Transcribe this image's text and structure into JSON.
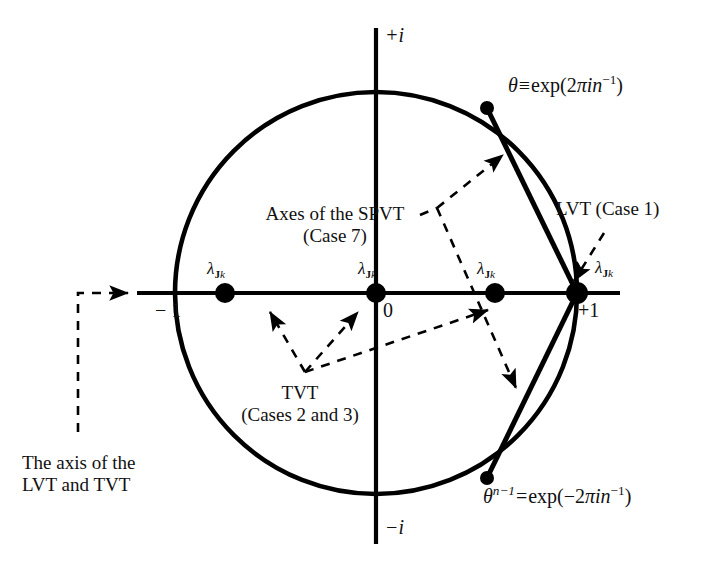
{
  "figure": {
    "background_color": "#ffffff",
    "stroke_color": "#000000"
  },
  "axes": {
    "imaginary_positive": "+i",
    "imaginary_negative": "−i",
    "real_negative": "− 1",
    "real_positive": "+1",
    "origin": "0"
  },
  "unit_circle": {
    "center_x": 376,
    "center_y": 293,
    "radius": 201
  },
  "points": [
    {
      "name": "eigenvalue-dot-left",
      "label": "lambda-Jk",
      "x": 225,
      "y": 293,
      "radius": 10
    },
    {
      "name": "eigenvalue-dot-origin",
      "label": "lambda-Jk",
      "x": 376,
      "y": 293,
      "radius": 10
    },
    {
      "name": "eigenvalue-dot-mid-right",
      "label": "lambda-Jk",
      "x": 495,
      "y": 293,
      "radius": 10
    },
    {
      "name": "eigenvalue-dot-plus-one",
      "label": "lambda-Jk",
      "x": 577,
      "y": 293,
      "radius": 11
    },
    {
      "name": "theta-dot-upper",
      "label": "theta",
      "x": 487,
      "y": 108,
      "radius": 7
    },
    {
      "name": "theta-dot-lower",
      "label": "theta-n-minus-1",
      "x": 487,
      "y": 478,
      "radius": 7
    }
  ],
  "lambda_labels": {
    "symbol": "λ",
    "subscript_bold": "J",
    "subscript_italic": "k",
    "count": 4
  },
  "annotations": {
    "theta_upper": {
      "symbol": "θ",
      "relation": "≡",
      "expression": "exp(2πin⁻¹)",
      "plain": "θ ≡ exp(2πin⁻¹)"
    },
    "theta_lower": {
      "symbol": "θ",
      "exponent": "n−1",
      "relation": "=",
      "expression": "exp(−2πin⁻¹)",
      "plain": "θⁿ⁻¹ = exp(−2πin⁻¹)"
    },
    "spvt": {
      "line1": "Axes of the SPVT",
      "line2": "(Case 7)"
    },
    "tvt": {
      "line1": "TVT",
      "line2": "(Cases 2 and 3)"
    },
    "lvt": {
      "line1": "LVT (Case 1)"
    },
    "axis_note": {
      "line1": "The axis of the",
      "line2": "LVT and TVT"
    }
  }
}
